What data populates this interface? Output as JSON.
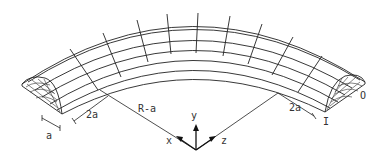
{
  "diagram": {
    "dimensions": {
      "radius_label": "R-a",
      "width_left_label": "2a",
      "width_right_label": "2a",
      "thickness_label": "a"
    },
    "end_labels": {
      "inner": "I",
      "outer": "O"
    },
    "axes": {
      "x": "x",
      "y": "y",
      "z": "z"
    },
    "colors": {
      "line": "#222222",
      "background": "#ffffff"
    }
  }
}
